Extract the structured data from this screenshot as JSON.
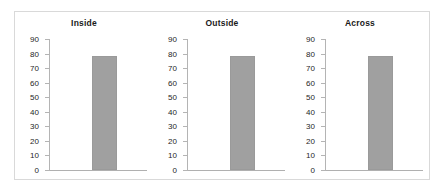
{
  "chart_data": {
    "type": "bar",
    "title": "",
    "xlabel": "",
    "ylabel": "",
    "ylim": [
      0,
      90
    ],
    "yticks": [
      90,
      80,
      70,
      60,
      50,
      40,
      30,
      20,
      10,
      0
    ],
    "grid": false,
    "legend": null,
    "bar_color": "#a0a0a0",
    "panels": [
      {
        "label": "Inside",
        "categories": [
          "Inside"
        ],
        "values": [
          78
        ]
      },
      {
        "label": "Outside",
        "categories": [
          "Outside"
        ],
        "values": [
          78
        ]
      },
      {
        "label": "Across",
        "categories": [
          "Across"
        ],
        "values": [
          78
        ]
      }
    ]
  },
  "figure": {
    "border_color": "#d9d9d9",
    "background": "#ffffff"
  }
}
